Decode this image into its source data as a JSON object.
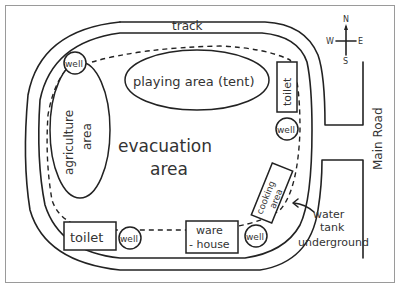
{
  "map": {
    "track_label": "track",
    "compass": {
      "n": "N",
      "s": "S",
      "e": "E",
      "w": "W"
    },
    "road_label": "Main Road",
    "center_label_line1": "evacuation",
    "center_label_line2": "area",
    "playing_area": "playing area (tent)",
    "agriculture_line1": "agriculture",
    "agriculture_line2": "area",
    "toilet_top": "toilet",
    "toilet_bottom": "toilet",
    "warehouse_line1": "ware",
    "warehouse_line2": "- house",
    "cooking_line1": "cooking",
    "cooking_line2": "area",
    "well_label": "well",
    "annotation_line1": "water",
    "annotation_line2": "tank",
    "annotation_line3": "underground"
  }
}
